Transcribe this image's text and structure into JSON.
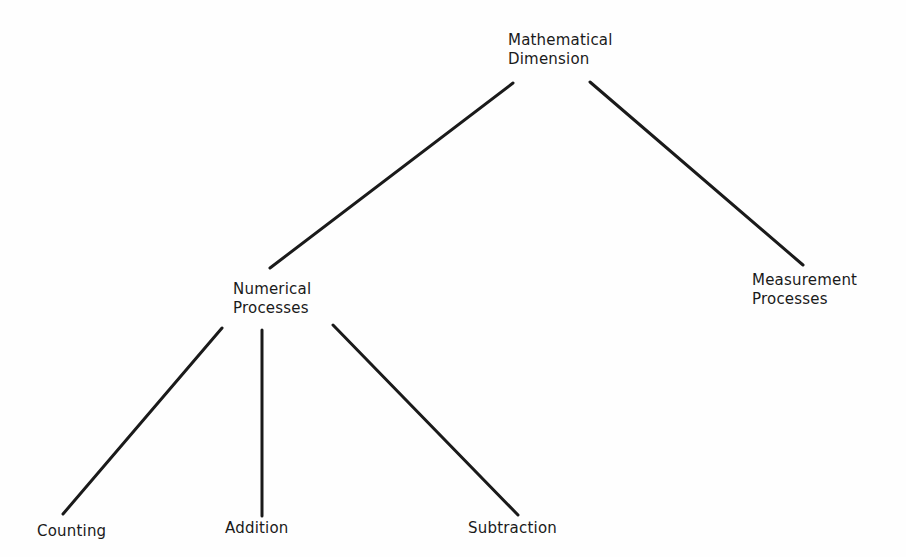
{
  "diagram": {
    "type": "tree",
    "root": {
      "id": "mathematical-dimension",
      "lines": [
        "Mathematical",
        "Dimension"
      ],
      "children": [
        "numerical-processes",
        "measurement-processes"
      ]
    },
    "nodes": {
      "mathematical_dimension": {
        "line1": "Mathematical",
        "line2": "Dimension"
      },
      "numerical_processes": {
        "line1": "Numerical",
        "line2": "Processes"
      },
      "measurement_processes": {
        "line1": "Measurement",
        "line2": "Processes"
      },
      "counting": {
        "label": "Counting"
      },
      "addition": {
        "label": "Addition"
      },
      "subtraction": {
        "label": "Subtraction"
      }
    },
    "edges": [
      {
        "from": "Mathematical Dimension",
        "to": "Numerical Processes"
      },
      {
        "from": "Mathematical Dimension",
        "to": "Measurement Processes"
      },
      {
        "from": "Numerical Processes",
        "to": "Counting"
      },
      {
        "from": "Numerical Processes",
        "to": "Addition"
      },
      {
        "from": "Numerical Processes",
        "to": "Subtraction"
      }
    ],
    "colors": {
      "line": "#1a1a1a",
      "text": "#1a1a1a",
      "background": "#ffffff"
    }
  }
}
